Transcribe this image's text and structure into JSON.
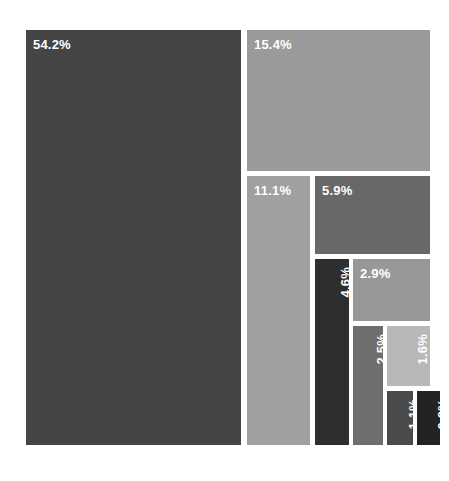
{
  "chart_data": {
    "type": "treemap",
    "title": "",
    "xlabel": "",
    "ylabel": "",
    "legend": "none",
    "grid": false,
    "value_unit": "percent",
    "labels": [
      "54.2%",
      "15.4%",
      "11.1%",
      "5.9%",
      "4.6%",
      "2.9%",
      "2.5%",
      "1.6%",
      "1.1%",
      "0.8%"
    ],
    "values": [
      54.2,
      15.4,
      11.1,
      5.9,
      4.6,
      2.9,
      2.5,
      1.6,
      1.1,
      0.8
    ],
    "categories": [
      "54.2%",
      "15.4%",
      "11.1%",
      "5.9%",
      "4.6%",
      "2.9%",
      "2.5%",
      "1.6%",
      "1.1%",
      "0.8%"
    ],
    "colors": [
      "#454545",
      "#9a9a9a",
      "#a0a0a0",
      "#686868",
      "#2e2e2e",
      "#989898",
      "#6e6e6e",
      "#b8b8b8",
      "#4a4a4a",
      "#232323"
    ],
    "tiles": [
      {
        "label": "54.2%",
        "value": 54.2,
        "color": "#454545",
        "text_color": "#ffffff",
        "orientation": "horizontal",
        "x": 0,
        "y": 0,
        "w": 215,
        "h": 415
      },
      {
        "label": "15.4%",
        "value": 15.4,
        "color": "#9a9a9a",
        "text_color": "#ffffff",
        "orientation": "horizontal",
        "x": 221,
        "y": 0,
        "w": 183,
        "h": 141
      },
      {
        "label": "11.1%",
        "value": 11.1,
        "color": "#a0a0a0",
        "text_color": "#ffffff",
        "orientation": "horizontal",
        "x": 221,
        "y": 146,
        "w": 63,
        "h": 269
      },
      {
        "label": "5.9%",
        "value": 5.9,
        "color": "#686868",
        "text_color": "#ffffff",
        "orientation": "horizontal",
        "x": 289,
        "y": 146,
        "w": 115,
        "h": 78
      },
      {
        "label": "4.6%",
        "value": 4.6,
        "color": "#2e2e2e",
        "text_color": "#ffffff",
        "orientation": "vertical",
        "x": 289,
        "y": 229,
        "w": 34,
        "h": 186
      },
      {
        "label": "2.9%",
        "value": 2.9,
        "color": "#989898",
        "text_color": "#ffffff",
        "orientation": "horizontal",
        "x": 327,
        "y": 229,
        "w": 77,
        "h": 62
      },
      {
        "label": "2.5%",
        "value": 2.5,
        "color": "#6e6e6e",
        "text_color": "#ffffff",
        "orientation": "vertical",
        "x": 327,
        "y": 296,
        "w": 30,
        "h": 119
      },
      {
        "label": "1.6%",
        "value": 1.6,
        "color": "#b8b8b8",
        "text_color": "#ffffff",
        "orientation": "vertical",
        "x": 361,
        "y": 296,
        "w": 43,
        "h": 60
      },
      {
        "label": "1.1%",
        "value": 1.1,
        "color": "#4a4a4a",
        "text_color": "#ffffff",
        "orientation": "vertical",
        "x": 361,
        "y": 361,
        "w": 26,
        "h": 54
      },
      {
        "label": "0.8%",
        "value": 0.8,
        "color": "#232323",
        "text_color": "#ffffff",
        "orientation": "vertical",
        "x": 391,
        "y": 361,
        "w": 23,
        "h": 54
      }
    ]
  },
  "figure": {
    "background": "#ffffff",
    "tile_gap_color": "#ffffff"
  }
}
